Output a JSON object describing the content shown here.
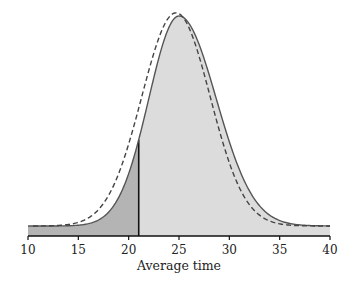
{
  "chart_data": {
    "type": "area",
    "title": "",
    "xlabel": "Average time",
    "ylabel": "",
    "xlim": [
      10,
      40
    ],
    "xticks": [
      10,
      15,
      20,
      25,
      30,
      35,
      40
    ],
    "grid": false,
    "legend": null,
    "series": [
      {
        "name": "sampling distribution (empirical)",
        "style": "solid",
        "color": "#555555",
        "shape": "slightly right-skewed bell",
        "peak_x": 25.0,
        "relative_height": 1.0
      },
      {
        "name": "normal approximation",
        "style": "dashed",
        "color": "#444444",
        "shape": "normal",
        "mean": 24.7,
        "sd": 3.4,
        "relative_height": 1.015
      }
    ],
    "shaded_regions": [
      {
        "from": 10,
        "to": 21,
        "fill": "#b4b4b4",
        "label": "below cutoff"
      },
      {
        "from": 21,
        "to": 40,
        "fill": "#dcdcdc",
        "label": "above cutoff"
      }
    ],
    "annotations": [
      {
        "type": "vertical-line",
        "x": 21,
        "color": "#111111"
      }
    ]
  }
}
